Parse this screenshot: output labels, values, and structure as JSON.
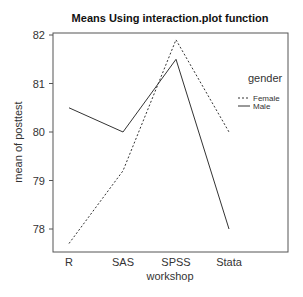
{
  "chart_data": {
    "type": "line",
    "title": "Means Using interaction.plot function",
    "xlabel": "workshop",
    "ylabel": "mean of posttest",
    "categories": [
      "R",
      "SAS",
      "SPSS",
      "Stata"
    ],
    "series": [
      {
        "name": "Female",
        "line_style": "dashed",
        "values": [
          77.7,
          79.2,
          81.9,
          80.0
        ]
      },
      {
        "name": "Male",
        "line_style": "solid",
        "values": [
          80.5,
          80.0,
          81.5,
          78.0
        ]
      }
    ],
    "ylim": [
      77.6,
      82.05
    ],
    "yticks": [
      78,
      79,
      80,
      81,
      82
    ],
    "grid": false,
    "legend": {
      "title": "gender",
      "position": "top-right",
      "entries": [
        "Female",
        "Male"
      ]
    },
    "colors": {
      "line": "#333333",
      "axis": "#555555"
    }
  }
}
